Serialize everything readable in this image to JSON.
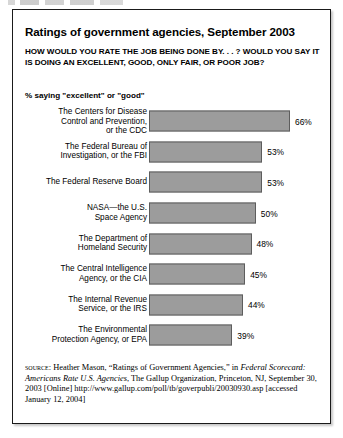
{
  "figure": {
    "title": "Ratings of government agencies, September 2003",
    "question": "HOW WOULD YOU RATE THE JOB BEING DONE BY. . . ? WOULD YOU SAY IT IS DOING AN EXCELLENT, GOOD, ONLY FAIR, OR POOR JOB?",
    "legend_note": "% saying \"excellent\" or \"good\"",
    "source": {
      "label": "SOURCE:",
      "author": " Heather Mason, “Ratings of Government Agencies,” in ",
      "publication_italic": "Federal Scorecard: Americans Rate U.S. Agencies",
      "tail": ", The Gallup Organization, Princeton, NJ, September 30, 2003 [Online] http://www.gallup.com/poll/tb/goverpubli/20030930.asp [accessed January 12, 2004]"
    }
  },
  "chart_data": {
    "type": "bar",
    "orientation": "horizontal",
    "title": "Ratings of government agencies, September 2003",
    "subtitle": "HOW WOULD YOU RATE THE JOB BEING DONE BY. . . ? WOULD YOU SAY IT IS DOING AN EXCELLENT, GOOD, ONLY FAIR, OR POOR JOB?",
    "xlabel": "",
    "ylabel": "",
    "value_unit": "%",
    "value_suffix": "%",
    "grid": false,
    "legend": "% saying \"excellent\" or \"good\"",
    "xlim": [
      0,
      66
    ],
    "bar_color": "#9c9c9c",
    "bar_border_color": "#5d5d5d",
    "categories": [
      "The Centers for Disease Control and Prevention, or the CDC",
      "The Federal Bureau of Investigation, or the FBI",
      "The Federal Reserve Board",
      "NASA—the U.S. Space Agency",
      "The Department of Homeland Security",
      "The Central Intelligence Agency, or the CIA",
      "The Internal Revenue Service, or the IRS",
      "The Environmental Protection Agency, or EPA"
    ],
    "values": [
      66,
      53,
      53,
      50,
      48,
      45,
      44,
      39
    ],
    "bars": [
      {
        "label_lines": "The Centers for Disease\nControl and Prevention,\nor the CDC",
        "value": 66,
        "value_label": "66%"
      },
      {
        "label_lines": "The Federal Bureau of\nInvestigation, or the FBI",
        "value": 53,
        "value_label": "53%"
      },
      {
        "label_lines": "The Federal Reserve Board",
        "value": 53,
        "value_label": "53%"
      },
      {
        "label_lines": "NASA—the U.S.\nSpace Agency",
        "value": 50,
        "value_label": "50%"
      },
      {
        "label_lines": "The Department of\nHomeland Security",
        "value": 48,
        "value_label": "48%"
      },
      {
        "label_lines": "The Central Intelligence\nAgency, or the CIA",
        "value": 45,
        "value_label": "45%"
      },
      {
        "label_lines": "The Internal Revenue\nService, or the IRS",
        "value": 44,
        "value_label": "44%"
      },
      {
        "label_lines": "The Environmental\nProtection Agency, or EPA",
        "value": 39,
        "value_label": "39%"
      }
    ]
  }
}
